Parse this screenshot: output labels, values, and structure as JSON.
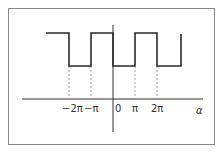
{
  "diagram": {
    "type": "square-wave",
    "axis": {
      "x_label": "α"
    },
    "ticks": [
      {
        "label": "−2π",
        "x": 69
      },
      {
        "label": "−π",
        "x": 91
      },
      {
        "label": "0",
        "x": 117
      },
      {
        "label": "π",
        "x": 135
      },
      {
        "label": "2π",
        "x": 157
      }
    ],
    "colors": {
      "line": "#2a2a2a",
      "dashed": "#777777",
      "frame": "#8a8a8a"
    }
  }
}
